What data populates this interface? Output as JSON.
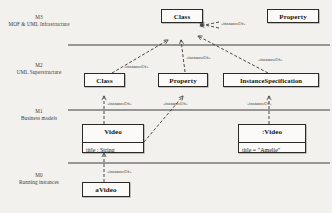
{
  "diagram": {
    "background_color": "#f2f1ee",
    "line_color": "#2a2926",
    "box_fill": "#fbfaf8"
  },
  "layers": [
    {
      "level": "M3",
      "description": "MOF & UML Infrastructure"
    },
    {
      "level": "M2",
      "description": "UML Superstructure"
    },
    {
      "level": "M1",
      "description": "Business models"
    },
    {
      "level": "M0",
      "description": "Running instances"
    }
  ],
  "boxes": {
    "m3_class": {
      "title": "Class"
    },
    "m3_property": {
      "title": "Property"
    },
    "m2_class": {
      "title": "Class"
    },
    "m2_property": {
      "title": "Property"
    },
    "m2_instancespec": {
      "title": "InstanceSpecification"
    },
    "m1_video": {
      "title": "Video",
      "attribute": "title : String"
    },
    "m1_video_instance": {
      "title": ":Video",
      "attribute": "title = \"Amelie\""
    },
    "m0_avideo": {
      "title": "aVideo"
    }
  },
  "stereotypes": {
    "m3_internal": "«instanceOf»",
    "m2_class_to_m3": "«instanceOf»",
    "m2_property_to_m3": "«instanceOf»",
    "m2_instancespec_to_m3": "«instanceOf»",
    "m1_video_to_m2_class": "«instanceOf»",
    "m1_attr_to_m2_property": "«instanceOf»",
    "m1_instance_to_m2_instancespec": "«instanceOf»",
    "m0_to_m1": "«instanceOf»"
  }
}
